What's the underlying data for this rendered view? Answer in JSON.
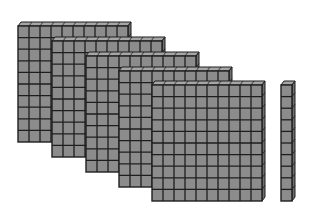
{
  "figure": {
    "colors": {
      "cube_fill": "#8c8c8c",
      "cube_top": "#a6a6a6",
      "cube_side": "#6e6e6e",
      "grid_line": "#1e1e1e",
      "background": "#ffffff"
    },
    "flats": [
      {
        "label": "hundreds-flat-1",
        "x": 18,
        "y": 26,
        "rows": 10,
        "cols": 10
      },
      {
        "label": "hundreds-flat-2",
        "x": 52,
        "y": 41,
        "rows": 10,
        "cols": 10
      },
      {
        "label": "hundreds-flat-3",
        "x": 86,
        "y": 56,
        "rows": 10,
        "cols": 10
      },
      {
        "label": "hundreds-flat-4",
        "x": 119,
        "y": 71,
        "rows": 10,
        "cols": 10
      },
      {
        "label": "hundreds-flat-5",
        "x": 152,
        "y": 85,
        "rows": 10,
        "cols": 10
      }
    ],
    "rods": [
      {
        "label": "tens-rod-1",
        "x": 281,
        "y": 85,
        "rows": 10,
        "cols": 1
      }
    ],
    "cell_w": 11,
    "cell_h": 11.6,
    "depth_x": 3,
    "depth_y": 4
  }
}
